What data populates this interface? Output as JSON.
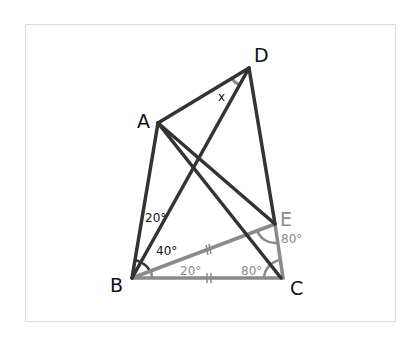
{
  "diagram": {
    "type": "geometry",
    "colors": {
      "dark": "#333333",
      "gray": "#8a8a8a",
      "frame": "#dcdcdc",
      "background": "#ffffff"
    },
    "points": {
      "A": {
        "label": "A",
        "x": 158,
        "y": 123
      },
      "B": {
        "label": "B",
        "x": 132,
        "y": 278
      },
      "C": {
        "label": "C",
        "x": 283,
        "y": 278
      },
      "D": {
        "label": "D",
        "x": 249,
        "y": 68
      },
      "E": {
        "label": "E",
        "x": 275,
        "y": 224
      }
    },
    "segments_dark": [
      "AD",
      "AB",
      "AC",
      "AE",
      "BD",
      "DE"
    ],
    "segments_gray": [
      "BE",
      "BC",
      "EC"
    ],
    "angles": {
      "ABD": "20°",
      "DBE": "40°",
      "EBC": "20°",
      "BCE": "80°",
      "BEC": "80°",
      "ADB": "x"
    },
    "equal_marks": [
      "BE",
      "BC"
    ]
  }
}
